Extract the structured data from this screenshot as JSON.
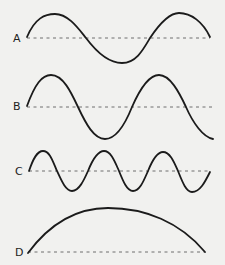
{
  "diagram": {
    "title": "",
    "background": "#f1f1ef",
    "stroke_color": "#1b1b1b",
    "baseline_color": "#6e6e6e",
    "waves": [
      {
        "label": "A",
        "description": "sine wave, about one and a half wavelengths, medium amplitude",
        "label_pos": {
          "x": 13,
          "y": 33
        },
        "baseline": {
          "x1": 27,
          "x2": 210,
          "y": 38
        },
        "path": "M27,37 C35,18 45,14 55,14 C68,14 78,28 86,38 C95,50 108,63 122,63 C136,63 143,50 150,38 C158,26 168,13 179,13 C191,13 203,22 210,37"
      },
      {
        "label": "B",
        "description": "sine wave, two wavelengths, larger amplitude",
        "label_pos": {
          "x": 13,
          "y": 101
        },
        "baseline": {
          "x1": 27,
          "x2": 212,
          "y": 107
        },
        "path": "M27,106 C35,84 42,75 51,75 C63,75 71,92 78,107 C86,124 94,139 105,139 C117,139 126,122 132,107 C139,91 148,75 159,75 C170,75 179,92 186,107 C193,123 203,137 213,139"
      },
      {
        "label": "C",
        "description": "sine wave, three wavelengths, shorter wavelength",
        "label_pos": {
          "x": 15,
          "y": 166
        },
        "baseline": {
          "x1": 29,
          "x2": 210,
          "y": 171
        },
        "path": "M29,171 C33,159 37,151 43,151 C50,151 53,162 57,171 C62,182 66,191 72,191 C79,191 84,180 88,171 C92,161 98,151 104,151 C111,151 115,162 119,171 C123,181 127,191 133,191 C140,191 144,180 148,171 C152,161 157,152 163,152 C170,152 174,162 178,171 C182,181 186,192 192,192 C200,192 205,182 210,172"
      },
      {
        "label": "D",
        "description": "half wavelength arc, long wavelength",
        "label_pos": {
          "x": 15,
          "y": 247
        },
        "baseline": {
          "x1": 28,
          "x2": 205,
          "y": 252
        },
        "path": "M28,253 C48,226 75,208 108,208 C145,208 180,222 205,252"
      }
    ]
  }
}
